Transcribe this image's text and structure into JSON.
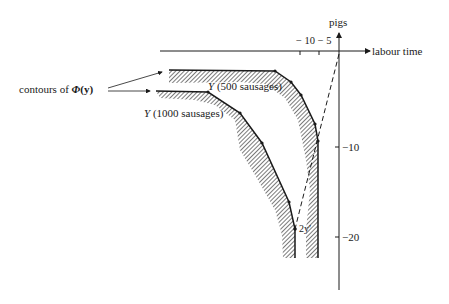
{
  "figure": {
    "axes": {
      "x_label": "labour time",
      "y_label": "pigs",
      "x_ticks": [
        "−10",
        "−5"
      ],
      "x_tick_combined": "− 10 − 5",
      "y_ticks": [
        "−10",
        "−20"
      ]
    },
    "curves": {
      "outer": {
        "symbol": "Y",
        "label": "(500 sausages)"
      },
      "inner": {
        "symbol": "Y",
        "label": "(1000 sausages)"
      }
    },
    "annotation": {
      "contours_prefix": "contours of ",
      "contours_symbol": "Φ",
      "contours_arg": "(y)",
      "point_label": "2y′"
    }
  }
}
